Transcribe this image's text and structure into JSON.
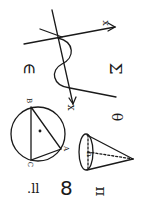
{
  "doodle": {
    "description": "Hand-drawn math symbols sketch, rotated 90 degrees",
    "stroke_color": "#1a1a1a",
    "background": "#ffffff",
    "labels": {
      "axis_label": "x",
      "epsilon": "∈",
      "sigma": "Σ",
      "theta": "θ",
      "eight": "8",
      "pi": "π",
      "therefore": ".ll",
      "circle_vertices": [
        "B",
        "C",
        "A"
      ],
      "cone_label": "h",
      "wave_end": "x"
    }
  }
}
